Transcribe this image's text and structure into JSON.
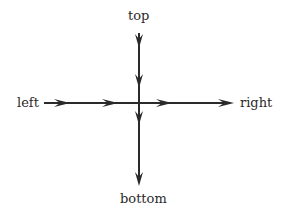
{
  "diagram": {
    "labels": {
      "top": "top",
      "left": "left",
      "right": "right",
      "bottom": "bottom"
    },
    "stroke_color": "#2a2a2a",
    "vertical_arrow": {
      "x": 139,
      "y_start": 33,
      "y_end": 187,
      "arrowheads_y": [
        48,
        88,
        125,
        186
      ],
      "direction": "down"
    },
    "horizontal_arrow": {
      "y": 103,
      "x_start": 44,
      "x_end": 234,
      "arrowheads_x": [
        70,
        118,
        172,
        234
      ],
      "direction": "right"
    }
  }
}
